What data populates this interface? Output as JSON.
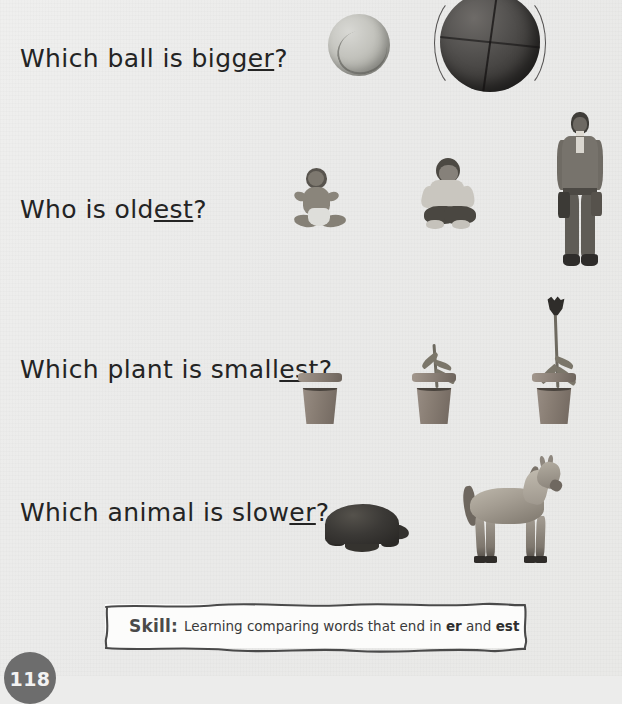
{
  "page": {
    "background_color": "#ececeb",
    "page_number": "118"
  },
  "questions": [
    {
      "id": "q1",
      "prefix": "Which ball is bigg",
      "suffix_underlined": "er",
      "terminator": "?",
      "full_text": "Which ball is bigger?",
      "items": [
        {
          "name": "tennis-ball",
          "label": "small light ball"
        },
        {
          "name": "basketball",
          "label": "large dark ball"
        }
      ]
    },
    {
      "id": "q2",
      "prefix": "Who is old",
      "suffix_underlined": "est",
      "terminator": "?",
      "full_text": "Who is oldest?",
      "items": [
        {
          "name": "baby",
          "label": "seated baby"
        },
        {
          "name": "boy",
          "label": "seated young boy"
        },
        {
          "name": "man",
          "label": "standing adult man"
        }
      ]
    },
    {
      "id": "q3",
      "prefix": "Which plant is small",
      "suffix_underlined": "est",
      "terminator": "?",
      "full_text": "Which plant is smallest?",
      "items": [
        {
          "name": "empty-pot",
          "label": "pot with no plant"
        },
        {
          "name": "sprout-pot",
          "label": "pot with small sprout"
        },
        {
          "name": "tulip-pot",
          "label": "pot with tall tulip"
        }
      ]
    },
    {
      "id": "q4",
      "prefix": "Which animal is slow",
      "suffix_underlined": "er",
      "terminator": "?",
      "full_text": "Which animal is slower?",
      "items": [
        {
          "name": "tortoise",
          "label": "tortoise"
        },
        {
          "name": "horse",
          "label": "horse"
        }
      ]
    }
  ],
  "skill_box": {
    "label": "Skill:",
    "text_before": "Learning comparing words that end in",
    "emphasis_1": "er",
    "conjunction": "and",
    "emphasis_2": "est",
    "full_text": "Skill: Learning comparing words that end in er and est"
  }
}
